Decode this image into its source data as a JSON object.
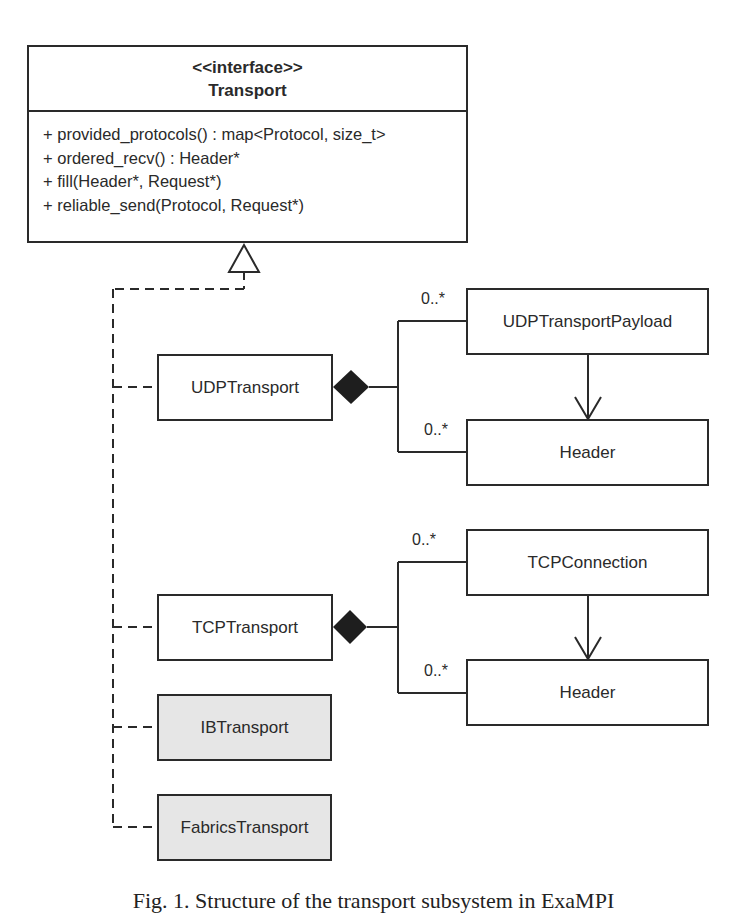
{
  "interface": {
    "stereotype": "<<interface>>",
    "name": "Transport",
    "operations": [
      "+ provided_protocols() : map<Protocol, size_t>",
      "+ ordered_recv() : Header*",
      "+ fill(Header*, Request*)",
      "+ reliable_send(Protocol, Request*)"
    ]
  },
  "implementations": [
    {
      "name": "UDPTransport",
      "shaded": false
    },
    {
      "name": "TCPTransport",
      "shaded": false
    },
    {
      "name": "IBTransport",
      "shaded": true
    },
    {
      "name": "FabricsTransport",
      "shaded": true
    }
  ],
  "udp_components": {
    "payload": "UDPTransportPayload",
    "header": "Header",
    "payload_multiplicity": "0..*",
    "header_multiplicity": "0..*"
  },
  "tcp_components": {
    "connection": "TCPConnection",
    "header": "Header",
    "connection_multiplicity": "0..*",
    "header_multiplicity": "0..*"
  },
  "colors": {
    "line": "#2a2a2a",
    "shaded_fill": "#e6e6e6"
  },
  "caption": "Fig. 1. Structure of the transport subsystem in ExaMPI"
}
